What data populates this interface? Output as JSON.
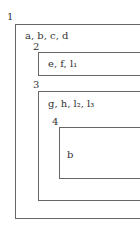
{
  "diagram": {
    "boxes": [
      {
        "number": "1",
        "content": "a, b, c, d"
      },
      {
        "number": "2",
        "content": "e, f, l₁"
      },
      {
        "number": "3",
        "content": "g, h, l₂, l₃"
      },
      {
        "number": "4",
        "content": "b"
      }
    ],
    "colors": {
      "line": "#666666",
      "text": "#333333",
      "background": "#ffffff"
    }
  }
}
